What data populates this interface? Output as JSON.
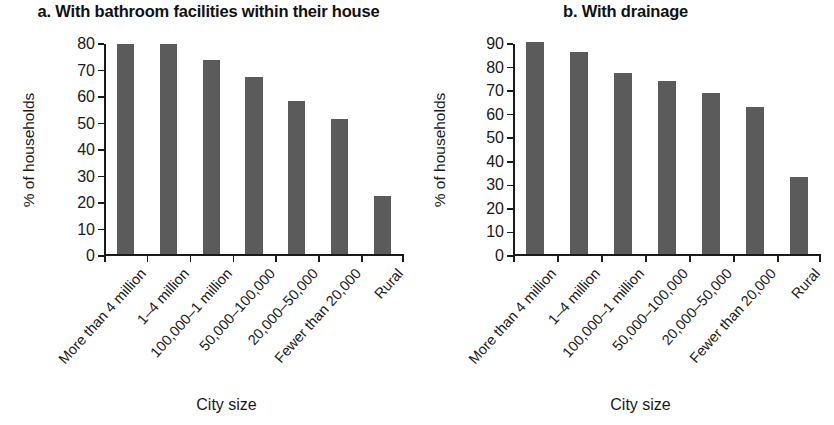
{
  "figure": {
    "background": "#ffffff",
    "bar_color": "#5b5b5b",
    "axis_color": "#1a1a1a"
  },
  "panels": [
    {
      "id": "panel-a",
      "title": "a. With bathroom facilities within their house",
      "ylabel": "% of households",
      "xlabel": "City size"
    },
    {
      "id": "panel-b",
      "title": "b. With drainage",
      "ylabel": "% of households",
      "xlabel": "City size"
    }
  ],
  "chart_data": [
    {
      "type": "bar",
      "title": "a. With bathroom facilities within their house",
      "xlabel": "City size",
      "ylabel": "% of households",
      "categories": [
        "More than 4 million",
        "1–4 million",
        "100,000–1 million",
        "50,000–100,000",
        "20,000–50,000",
        "Fewer than 20,000",
        "Rural"
      ],
      "values": [
        79.5,
        79.5,
        73.5,
        67,
        58,
        51,
        22
      ],
      "ylim": [
        0,
        80
      ],
      "yticks": [
        0,
        10,
        20,
        30,
        40,
        50,
        60,
        70,
        80
      ],
      "ytick_labels": [
        "0",
        "10",
        "20",
        "30",
        "40",
        "50",
        "60",
        "70",
        "80"
      ],
      "grid": false,
      "legend": false
    },
    {
      "type": "bar",
      "title": "b. With drainage",
      "xlabel": "City size",
      "ylabel": "% of households",
      "categories": [
        "More than 4 million",
        "1–4 million",
        "100,000–1 million",
        "50,000–100,000",
        "20,000–50,000",
        "Fewer than 20,000",
        "Rural"
      ],
      "values": [
        90,
        86,
        77,
        73.5,
        68.5,
        62.5,
        33
      ],
      "ylim": [
        0,
        90
      ],
      "yticks": [
        0,
        10,
        20,
        30,
        40,
        50,
        60,
        70,
        80,
        90
      ],
      "ytick_labels": [
        "0",
        "10",
        "20",
        "30",
        "40",
        "50",
        "60",
        "70",
        "80",
        "90"
      ],
      "grid": false,
      "legend": false
    }
  ]
}
